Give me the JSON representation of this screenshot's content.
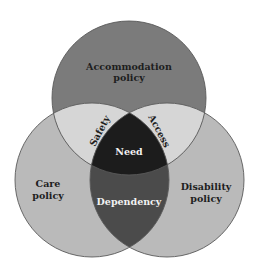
{
  "diagram": {
    "type": "venn",
    "sets": [
      {
        "id": "top",
        "label_line1": "Accommodation",
        "label_line2": "policy"
      },
      {
        "id": "left",
        "label_line1": "Care",
        "label_line2": "policy"
      },
      {
        "id": "right",
        "label_line1": "Disability",
        "label_line2": "policy"
      }
    ],
    "intersections": {
      "top_left": "Safety",
      "top_right": "Access",
      "left_right": "Dependency",
      "all_three": "Need"
    },
    "colors": {
      "top_only": "#7b7b7b",
      "side_only": "#bababa",
      "top_side_overlap": "#d6d6d6",
      "left_right_overlap": "#4b4b4b",
      "center": "#1c1c1c",
      "outline": "#5a5a5a"
    }
  }
}
